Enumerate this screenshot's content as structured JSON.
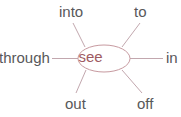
{
  "diagram": {
    "type": "word-web",
    "center": {
      "text": "see",
      "text_color": "#9e5a62",
      "ellipse_stroke": "#c79aa0",
      "ellipse_fill": "#ffffff"
    },
    "label_color": "#58585a",
    "spoke_color": "#c2a7ae",
    "background": "#ffffff",
    "nodes": [
      {
        "id": "into",
        "label": "into",
        "position": "upper-left"
      },
      {
        "id": "to",
        "label": "to",
        "position": "upper-right"
      },
      {
        "id": "through",
        "label": "through",
        "position": "left"
      },
      {
        "id": "in",
        "label": "in",
        "position": "right"
      },
      {
        "id": "out",
        "label": "out",
        "position": "lower-left"
      },
      {
        "id": "off",
        "label": "off",
        "position": "lower-right"
      }
    ]
  }
}
